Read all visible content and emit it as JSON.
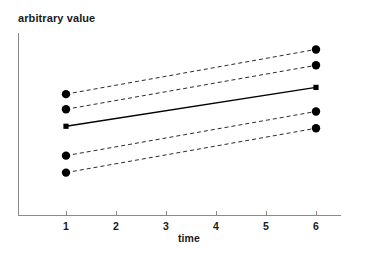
{
  "chart_data": {
    "type": "line",
    "title": "",
    "xlabel": "time",
    "ylabel": "arbitrary value",
    "x": [
      1,
      6
    ],
    "xticks": [
      1,
      2,
      3,
      4,
      5,
      6
    ],
    "xticklabels": [
      "1",
      "2",
      "3",
      "4",
      "5",
      "6"
    ],
    "xlim": [
      0.5,
      6.7
    ],
    "ylim": [
      0,
      100
    ],
    "grid": false,
    "legend": false,
    "legend_position": "none",
    "yticks": [],
    "yticklabels": [],
    "series": [
      {
        "name": "upper-outer",
        "style": "dashed",
        "marker": "circle",
        "values": [
          66.5,
          91.0
        ],
        "color": "#2b2b2b"
      },
      {
        "name": "upper-inner",
        "style": "dashed",
        "marker": "circle",
        "values": [
          58.2,
          82.3
        ],
        "color": "#2b2b2b"
      },
      {
        "name": "mean",
        "style": "solid",
        "marker": "square",
        "values": [
          48.9,
          70.2
        ],
        "color": "#000000"
      },
      {
        "name": "lower-inner",
        "style": "dashed",
        "marker": "circle",
        "values": [
          32.8,
          57.0
        ],
        "color": "#2b2b2b"
      },
      {
        "name": "lower-outer",
        "style": "dashed",
        "marker": "circle",
        "values": [
          23.5,
          47.8
        ],
        "color": "#2b2b2b"
      }
    ],
    "annotations": []
  },
  "axis": {
    "x_axis_label": "time",
    "y_axis_label": "arbitrary value",
    "tick_labels": [
      "1",
      "2",
      "3",
      "4",
      "5",
      "6"
    ]
  },
  "colors": {
    "axis": "#8a8a8a",
    "mean_line": "#000000",
    "dashed_line": "#2b2b2b",
    "marker": "#000000",
    "background": "#ffffff",
    "text": "#1a1a1a"
  }
}
